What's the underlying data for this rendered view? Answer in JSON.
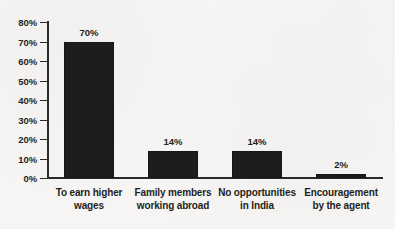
{
  "chart_data": {
    "type": "bar",
    "title": "",
    "subtitle": "",
    "xlabel": "",
    "ylabel": "",
    "categories": [
      "To earn higher wages",
      "Family members working abroad",
      "No opportunities in India",
      "Encouragement by the agent"
    ],
    "category_lines": [
      [
        "To earn higher",
        "wages"
      ],
      [
        "Family members",
        "working abroad"
      ],
      [
        "No opportunities",
        "in India"
      ],
      [
        "Encouragement",
        "by the agent"
      ]
    ],
    "values": [
      70,
      14,
      14,
      2
    ],
    "value_labels": [
      "70%",
      "14%",
      "14%",
      "2%"
    ],
    "ylim": [
      0,
      80
    ],
    "ytick_values": [
      0,
      10,
      20,
      30,
      40,
      50,
      60,
      70,
      80
    ],
    "ytick_labels": [
      "0%",
      "10%",
      "20%",
      "30%",
      "40%",
      "50%",
      "60%",
      "70%",
      "80%"
    ],
    "grid": false,
    "legend": false,
    "legend_position": "none",
    "bar_color": "#1d1d1d",
    "axis_color": "#2a2a2a",
    "background_color": "#f6f5f3"
  }
}
